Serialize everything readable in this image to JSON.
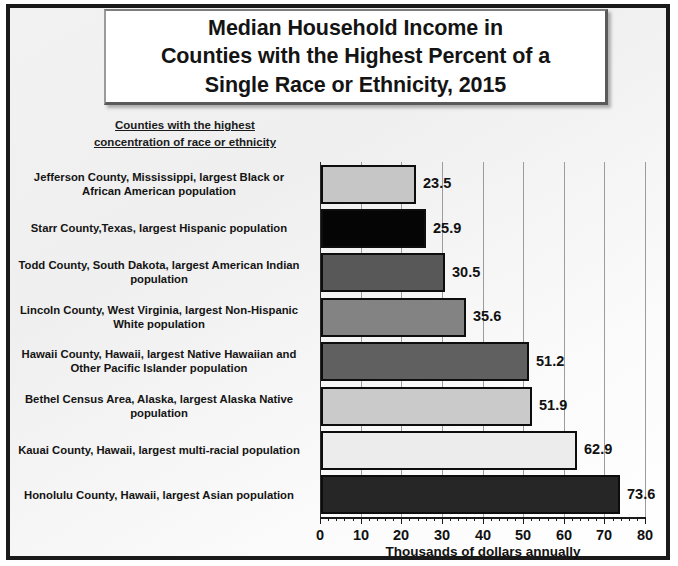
{
  "title": {
    "lines": [
      "Median Household Income in",
      "Counties with the Highest Percent of a",
      "Single Race or Ethnicity, 2015"
    ]
  },
  "subtitle": {
    "lines": [
      "Counties with the highest",
      "concentration of race or ethnicity"
    ]
  },
  "chart_data": {
    "type": "bar",
    "orientation": "horizontal",
    "title": "Median Household Income in Counties with the Highest Percent of a Single Race or Ethnicity, 2015",
    "xlabel": "Thousands of dollars annually",
    "ylabel": "Counties with the highest concentration of race or ethnicity",
    "xlim": [
      0,
      80
    ],
    "xticks": [
      0,
      10,
      20,
      30,
      40,
      50,
      60,
      70,
      80
    ],
    "xtick_labels": [
      "0",
      "10",
      "20",
      "30",
      "40",
      "50",
      "60",
      "70",
      "80"
    ],
    "minor_tick_step": 2,
    "grid": "vertical-major",
    "legend": "none",
    "categories": [
      "Jefferson County, Mississippi, largest Black or African American population",
      "Starr County,Texas, largest Hispanic population",
      "Todd County, South Dakota, largest American Indian population",
      "Lincoln County, West Virginia, largest Non-Hispanic White population",
      "Hawaii County, Hawaii, largest Native Hawaiian and Other Pacific Islander population",
      "Bethel Census Area, Alaska, largest Alaska Native population",
      "Kauai County, Hawaii, largest multi-racial population",
      "Honolulu County, Hawaii, largest Asian population"
    ],
    "category_lines": [
      "Jefferson County, Mississippi, largest Black or\nAfrican American population",
      "Starr County,Texas, largest Hispanic population",
      "Todd County, South Dakota, largest American Indian\npopulation",
      "Lincoln County, West Virginia, largest Non-Hispanic\nWhite population",
      "Hawaii County, Hawaii, largest Native Hawaiian and\nOther Pacific Islander population",
      "Bethel Census Area, Alaska, largest Alaska Native\npopulation",
      "Kauai County, Hawaii, largest multi-racial population",
      "Honolulu County, Hawaii, largest Asian population"
    ],
    "values": [
      23.5,
      25.9,
      30.5,
      35.6,
      51.2,
      51.9,
      62.9,
      73.6
    ],
    "value_labels": [
      "23.5",
      "25.9",
      "30.5",
      "35.6",
      "51.2",
      "51.9",
      "62.9",
      "73.6"
    ],
    "bar_colors": [
      "#c6c6c6",
      "#050505",
      "#585858",
      "#838383",
      "#606060",
      "#cacaca",
      "#ececec",
      "#262626"
    ],
    "bar_border_color": "#0d0d0d"
  }
}
